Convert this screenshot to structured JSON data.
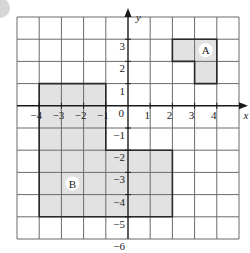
{
  "figure": {
    "type": "coordinate-grid",
    "x_axis": {
      "label": "x",
      "min": -5,
      "max": 5,
      "tick_labels": [
        "-4",
        "-3",
        "-2",
        "-1",
        "1",
        "2",
        "3",
        "4"
      ]
    },
    "y_axis": {
      "label": "y",
      "min": -6,
      "max": 4,
      "tick_labels": [
        "3",
        "2",
        "1",
        "-1",
        "-2",
        "-3",
        "-4",
        "-5",
        "-6"
      ]
    },
    "origin_label": "0",
    "shapes": [
      {
        "name": "A",
        "label": "A",
        "vertices": [
          [
            2,
            3
          ],
          [
            4,
            3
          ],
          [
            4,
            1
          ],
          [
            3,
            1
          ],
          [
            3,
            2
          ],
          [
            2,
            2
          ]
        ],
        "label_pos": [
          3.5,
          2.5
        ]
      },
      {
        "name": "B",
        "label": "B",
        "vertices": [
          [
            -4,
            1
          ],
          [
            -1,
            1
          ],
          [
            -1,
            -2
          ],
          [
            2,
            -2
          ],
          [
            2,
            -5
          ],
          [
            -4,
            -5
          ]
        ],
        "label_pos": [
          -2.5,
          -3.5
        ]
      }
    ],
    "colors": {
      "grid": "#6b6b6b",
      "axis": "#1a1a1a",
      "shape_fill": "#e2e2e2",
      "shape_stroke": "#2a2a2a",
      "label_bg": "#ffffff"
    }
  }
}
